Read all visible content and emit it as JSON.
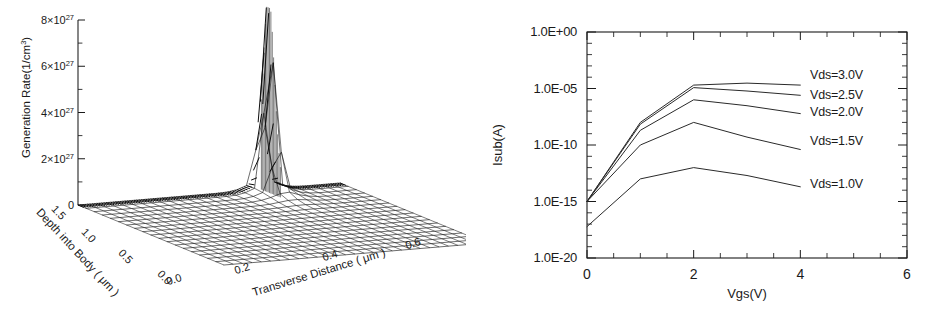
{
  "figure": {
    "panels": [
      "surface-plot",
      "line-plot"
    ]
  },
  "left_panel": {
    "name": "generation-rate-surface",
    "z_axis": {
      "label": "Generation Rate(1/cm",
      "label_sup": "3",
      "label_close": ")",
      "ticks": [
        "0",
        "2×10",
        "4×10",
        "6×10",
        "8×10"
      ],
      "tick_exponent": "27"
    },
    "x_axis": {
      "label": "Transverse Distance ( μm )",
      "ticks": [
        "0.0",
        "0.2",
        "0.4",
        "0.6"
      ]
    },
    "y_axis": {
      "label": "Depth into Body ( μm )",
      "ticks": [
        "1.5",
        "1.0",
        "0.5",
        "0.0"
      ]
    }
  },
  "right_panel": {
    "name": "isub-vs-vgs",
    "legend": [
      {
        "label": "Vds=3.0V"
      },
      {
        "label": "Vds=2.5V"
      },
      {
        "label": "Vds=2.0V"
      },
      {
        "label": "Vds=1.5V"
      },
      {
        "label": "Vds=1.0V"
      }
    ]
  },
  "chart_data": [
    {
      "type": "surface",
      "title": "",
      "xlabel": "Transverse Distance ( μm )",
      "ylabel": "Depth into Body ( μm )",
      "zlabel": "Generation Rate(1/cm3)",
      "xlim": [
        0.0,
        0.8
      ],
      "ylim": [
        0.0,
        1.5
      ],
      "zlim": [
        0,
        8e+27
      ],
      "xticks": [
        0.0,
        0.2,
        0.4,
        0.6
      ],
      "yticks": [
        1.5,
        1.0,
        0.5,
        0.0
      ],
      "zticks": [
        0,
        2e+27,
        4e+27,
        6e+27,
        8e+27
      ],
      "ztick_labels": [
        "0",
        "2×10^27",
        "4×10^27",
        "6×10^27",
        "8×10^27"
      ],
      "grid": true,
      "legend": "none",
      "description": "Mesh surface, flat near zero over most of the domain with a single very sharp narrow peak reaching 8e27 located near the back edge at transverse distance ~0.55 um and small depth.",
      "peak": {
        "x": 0.55,
        "y": 0.05,
        "z": 8e+27
      },
      "surface_grid": {
        "nx": 28,
        "ny": 18
      }
    },
    {
      "type": "line",
      "title": "",
      "xlabel": "Vgs(V)",
      "ylabel": "Isub(A)",
      "xlim": [
        0,
        6
      ],
      "ylim": [
        1e-20,
        1.0
      ],
      "yscale": "log",
      "xticks": [
        0,
        2,
        4,
        6
      ],
      "xtick_labels": [
        "0",
        "2",
        "4",
        "6"
      ],
      "yticks": [
        1e-20,
        1e-15,
        1e-10,
        1e-05,
        1.0
      ],
      "ytick_labels": [
        "1.0E-20",
        "1.0E-15",
        "1.0E-10",
        "1.0E-05",
        "1.0E+00"
      ],
      "grid": false,
      "legend": "inline-right",
      "x": [
        0,
        1,
        2,
        3,
        4
      ],
      "series": [
        {
          "name": "Vds=3.0V",
          "values": [
            1e-15,
            1e-08,
            2e-05,
            3e-05,
            2e-05
          ]
        },
        {
          "name": "Vds=2.5V",
          "values": [
            1e-15,
            7e-09,
            1.2e-05,
            6e-06,
            2.5e-06
          ]
        },
        {
          "name": "Vds=2.0V",
          "values": [
            1e-15,
            2e-09,
            1e-06,
            3e-07,
            6e-08
          ]
        },
        {
          "name": "Vds=1.5V",
          "values": [
            1e-15,
            1e-10,
            1e-08,
            5e-10,
            4e-11
          ]
        },
        {
          "name": "Vds=1.0V",
          "values": [
            6e-18,
            1e-13,
            1e-12,
            2e-13,
            2e-14
          ]
        }
      ]
    }
  ]
}
